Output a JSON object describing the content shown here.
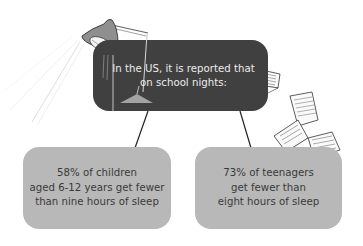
{
  "header": {
    "lines": [
      "In the US, it is reported that",
      "on school nights:"
    ]
  },
  "facts": [
    {
      "lines": [
        "58% of children",
        "aged 6-12 years get fewer",
        "than nine hours of sleep"
      ],
      "percent": "58%",
      "group": "children aged 6-12 years"
    },
    {
      "lines": [
        "73% of teenagers",
        "get fewer than",
        "eight hours of sleep"
      ],
      "percent": "73%",
      "group": "teenagers"
    }
  ],
  "decorations": [
    "desk-lamp-icon",
    "open-book-icon",
    "paper-sheet-icon",
    "open-book-icon"
  ],
  "colors": {
    "dark_box": "#404040",
    "grey_box": "#b8b8b8",
    "dark_text": "#ececec",
    "grey_text": "#3a3a3a"
  }
}
